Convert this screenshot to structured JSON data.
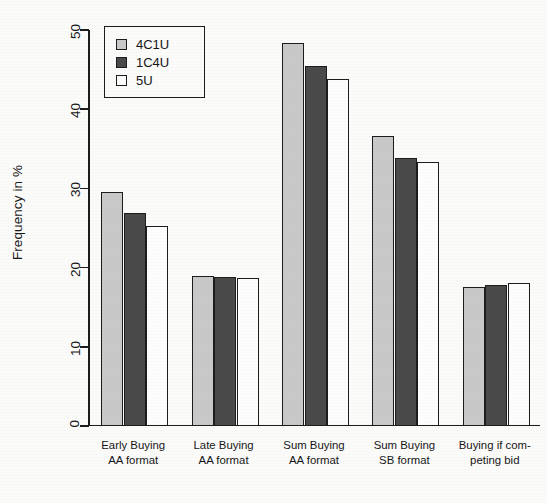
{
  "chart_data": {
    "type": "bar",
    "title": "",
    "xlabel": "",
    "ylabel": "Frequency in %",
    "ylim": [
      0,
      50
    ],
    "yticks": [
      0,
      10,
      20,
      30,
      40,
      50
    ],
    "ytick_labels": [
      "0",
      "10",
      "20",
      "30",
      "40",
      "50"
    ],
    "grid": false,
    "legend_position": "top-left",
    "categories": [
      "Early Buying\nAA format",
      "Late Buying\nAA format",
      "Sum Buying\nAA format",
      "Sum Buying\nSB format",
      "Buying if com-\npeting bid"
    ],
    "series": [
      {
        "name": "4C1U",
        "color": "#c9c9c9",
        "values": [
          29.5,
          19.0,
          48.4,
          36.6,
          17.5
        ]
      },
      {
        "name": "1C4U",
        "color": "#4a4a4a",
        "values": [
          26.9,
          18.8,
          45.5,
          33.9,
          17.8
        ]
      },
      {
        "name": "5U",
        "color": "#fdfdfd",
        "values": [
          25.3,
          18.7,
          43.8,
          33.3,
          18.0
        ]
      }
    ]
  },
  "legend": {
    "entries": [
      {
        "label": "4C1U",
        "swatch": "light-gray-swatch"
      },
      {
        "label": "1C4U",
        "swatch": "dark-gray-swatch"
      },
      {
        "label": "5U",
        "swatch": "white-swatch"
      }
    ]
  },
  "axes": {
    "y_title": "Frequency in %"
  }
}
